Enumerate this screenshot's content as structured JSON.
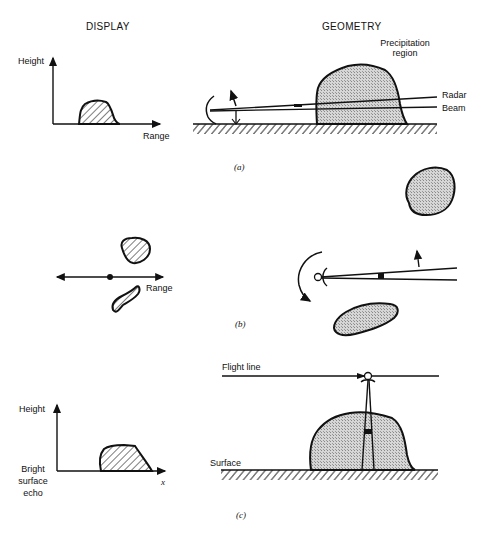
{
  "headers": {
    "display": "DISPLAY",
    "geometry": "GEOMETRY"
  },
  "panel_a": {
    "caption": "(a)",
    "display": {
      "y_axis_label": "Height",
      "x_axis_label": "Range"
    },
    "geometry": {
      "region_label_line1": "Precipitation",
      "region_label_line2": "region",
      "beam_label_line1": "Radar",
      "beam_label_line2": "Beam"
    }
  },
  "panel_b": {
    "caption": "(b)",
    "display": {
      "axis_label": "Range"
    }
  },
  "panel_c": {
    "caption": "(c)",
    "display": {
      "y_axis_label": "Height",
      "x_axis_label": "x",
      "echo_label_line1": "Bright",
      "echo_label_line2": "surface",
      "echo_label_line3": "echo"
    },
    "geometry": {
      "flight_line_label": "Flight line",
      "surface_label": "Surface"
    }
  },
  "colors": {
    "ink": "#111111",
    "stipple": "#c9c9c9",
    "background": "#ffffff"
  }
}
